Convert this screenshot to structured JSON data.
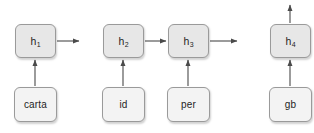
{
  "diagram": {
    "type": "unrolled-recurrent-network",
    "canvas": {
      "width": 314,
      "height": 133,
      "background": "#ffffff"
    },
    "colors": {
      "state_fill": "#e7e7e7",
      "token_fill": "#f3f3f3",
      "border": "#9a9a9a",
      "arrow": "#4a4a4a",
      "text": "#1e1e1e"
    },
    "state_nodes": [
      {
        "id": "h1",
        "base": "h",
        "sub": "1",
        "x": 15,
        "y": 24,
        "w": 41,
        "h": 34
      },
      {
        "id": "h2",
        "base": "h",
        "sub": "2",
        "x": 103,
        "y": 24,
        "w": 41,
        "h": 34
      },
      {
        "id": "h3",
        "base": "h",
        "sub": "3",
        "x": 168,
        "y": 24,
        "w": 41,
        "h": 34
      },
      {
        "id": "h4",
        "base": "h",
        "sub": "4",
        "x": 270,
        "y": 24,
        "w": 41,
        "h": 34
      }
    ],
    "token_nodes": [
      {
        "id": "t1",
        "label": "carta",
        "x": 14,
        "y": 87,
        "w": 43,
        "h": 35
      },
      {
        "id": "t2",
        "label": "id",
        "x": 102,
        "y": 87,
        "w": 43,
        "h": 35
      },
      {
        "id": "t3",
        "label": "per",
        "x": 167,
        "y": 87,
        "w": 43,
        "h": 35
      },
      {
        "id": "t4",
        "label": "gb",
        "x": 269,
        "y": 87,
        "w": 43,
        "h": 35
      }
    ],
    "edges": [
      {
        "id": "e-t1-h1",
        "from": "carta",
        "to": "h1",
        "direction": "up",
        "x1": 35,
        "y1": 86,
        "x2": 35,
        "y2": 60
      },
      {
        "id": "e-t2-h2",
        "from": "id",
        "to": "h2",
        "direction": "up",
        "x1": 123,
        "y1": 86,
        "x2": 123,
        "y2": 60
      },
      {
        "id": "e-t3-h3",
        "from": "per",
        "to": "h3",
        "direction": "up",
        "x1": 188,
        "y1": 86,
        "x2": 188,
        "y2": 60
      },
      {
        "id": "e-t4-h4",
        "from": "gb",
        "to": "h4",
        "direction": "up",
        "x1": 290,
        "y1": 86,
        "x2": 290,
        "y2": 60
      },
      {
        "id": "e-h1-out",
        "from": "h1",
        "to": "",
        "direction": "right",
        "x1": 57,
        "y1": 41,
        "x2": 79,
        "y2": 41
      },
      {
        "id": "e-h2-h3",
        "from": "h2",
        "to": "h3",
        "direction": "right",
        "x1": 145,
        "y1": 41,
        "x2": 166,
        "y2": 41
      },
      {
        "id": "e-h3-out",
        "from": "h3",
        "to": "",
        "direction": "right",
        "x1": 210,
        "y1": 41,
        "x2": 237,
        "y2": 41
      },
      {
        "id": "e-h4-out",
        "from": "h4",
        "to": "",
        "direction": "up",
        "x1": 290,
        "y1": 23,
        "x2": 290,
        "y2": 5
      }
    ]
  }
}
